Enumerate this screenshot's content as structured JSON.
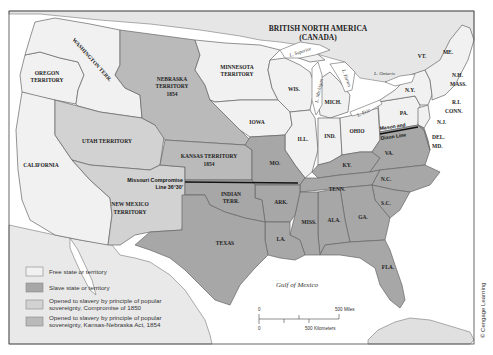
{
  "map": {
    "title_region": "BRITISH NORTH AMERICA",
    "title_region_sub": "(CANADA)",
    "colors": {
      "free": "#f1f1f1",
      "slave": "#a7a7a7",
      "compromise_1850": "#d2d2d2",
      "kansas_nebraska_1854": "#bababa",
      "water": "#ffffff",
      "foreign": "#e6e6e6",
      "border": "#666666",
      "line": "#111111"
    },
    "labels": {
      "washington": "WASHINGTON TERR.",
      "oregon_1": "OREGON",
      "oregon_2": "TERRITORY",
      "nebraska_1": "NEBRASKA",
      "nebraska_2": "TERRITORY",
      "nebraska_3": "1854",
      "minnesota_1": "MINNESOTA",
      "minnesota_2": "TERRITORY",
      "utah": "UTAH TERRITORY",
      "california": "CALIFORNIA",
      "kansas_1": "KANSAS TERRITORY",
      "kansas_2": "1854",
      "new_mexico_1": "NEW MEXICO",
      "new_mexico_2": "TERRITORY",
      "indian_1": "INDIAN",
      "indian_2": "TERR.",
      "texas": "TEXAS",
      "iowa": "IOWA",
      "wis": "WIS.",
      "mich": "MICH.",
      "ill": "ILL.",
      "ind": "IND.",
      "ohio": "OHIO",
      "mo": "MO.",
      "ky": "KY.",
      "tenn": "TENN.",
      "ark": "ARK.",
      "la": "LA.",
      "miss": "MISS.",
      "ala": "ALA.",
      "ga": "GA.",
      "sc": "S.C.",
      "nc": "N.C.",
      "va": "VA.",
      "fla": "FLA.",
      "pa": "PA.",
      "ny": "N.Y.",
      "vt": "VT.",
      "me": "ME.",
      "nh": "N.H.",
      "mass": "MASS.",
      "ri": "R.I.",
      "conn": "CONN.",
      "nj": "N.J.",
      "del": "DEL.",
      "md": "MD."
    },
    "lakes": {
      "superior": "L. Superior",
      "michigan": "L. Michigan",
      "huron": "L. Huron",
      "erie": "L. Erie",
      "ontario": "L. Ontario"
    },
    "water_labels": {
      "gulf": "Gulf of Mexico"
    },
    "lines": {
      "missouri_compromise_1": "Missouri Compromise",
      "missouri_compromise_2": "Line 36°30'",
      "mason_dixon_1": "Mason and",
      "mason_dixon_2": "Dixon Line"
    },
    "legend": [
      {
        "label": "Free state or territory",
        "color": "#f1f1f1"
      },
      {
        "label": "Slave state or territory",
        "color": "#a7a7a7"
      },
      {
        "label_1": "Opened to slavery by principle of popular",
        "label_2": "sovereignty, Compromise of 1850",
        "color": "#d2d2d2"
      },
      {
        "label_1": "Opened to slavery by principle of popular",
        "label_2": "sovereignty, Kansas-Nebraska Act, 1854",
        "color": "#bababa"
      }
    ],
    "scale": {
      "zero_top": "0",
      "miles": "500 Miles",
      "zero_bottom": "0",
      "km": "500 Kilometers"
    },
    "credit": "© Cengage Learning"
  }
}
